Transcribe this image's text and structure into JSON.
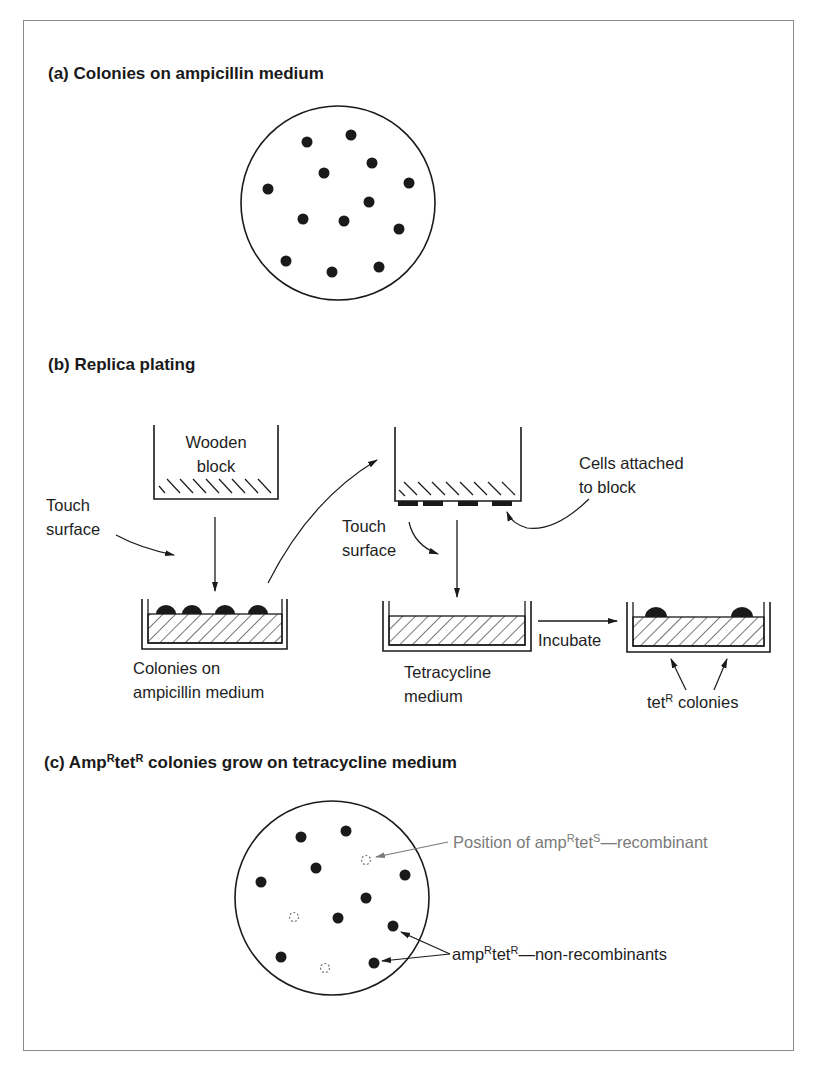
{
  "panels": {
    "a": {
      "title": "(a)  Colonies on ampicillin medium",
      "plate": {
        "center": [
          338,
          203
        ],
        "radius": 97,
        "colonies": [
          [
            307,
            142
          ],
          [
            351,
            135
          ],
          [
            372,
            163
          ],
          [
            324,
            173
          ],
          [
            409,
            183
          ],
          [
            268,
            189
          ],
          [
            369,
            202
          ],
          [
            303,
            219
          ],
          [
            344,
            221
          ],
          [
            399,
            229
          ],
          [
            286,
            261
          ],
          [
            332,
            272
          ],
          [
            379,
            267
          ]
        ]
      }
    },
    "b": {
      "title": "(b)  Replica plating",
      "wooden_block": {
        "line1": "Wooden",
        "line2": "block"
      },
      "touch_surface_1": {
        "line1": "Touch",
        "line2": "surface"
      },
      "touch_surface_2": {
        "line1": "Touch",
        "line2": "surface"
      },
      "cells_attached": {
        "line1": "Cells attached",
        "line2": "to block"
      },
      "dish_ampicillin": {
        "line1": "Colonies on",
        "line2": "ampicillin medium"
      },
      "dish_tetracycline": {
        "line1": "Tetracycline",
        "line2": "medium"
      },
      "incubate": "Incubate",
      "tet_colonies": {
        "prefix": "tet",
        "sup": "R",
        "suffix": " colonies"
      }
    },
    "c": {
      "title_prefix": "(c)  Amp",
      "title_sup1": "R",
      "title_mid": "tet",
      "title_sup2": "R",
      "title_suffix": " colonies grow on tetracycline medium",
      "plate": {
        "center": [
          332,
          898
        ],
        "radius": 97,
        "colonies": [
          [
            301,
            837
          ],
          [
            346,
            831
          ],
          [
            316,
            868
          ],
          [
            261,
            882
          ],
          [
            405,
            875
          ],
          [
            366,
            898
          ],
          [
            338,
            918
          ],
          [
            393,
            926
          ],
          [
            281,
            957
          ],
          [
            374,
            963
          ]
        ],
        "missing_positions": [
          [
            366,
            860
          ],
          [
            294,
            917
          ],
          [
            325,
            968
          ]
        ]
      },
      "recombinant_label": {
        "prefix": "Position of amp",
        "sup1": "R",
        "mid": "tet",
        "sup2": "S",
        "suffix": "—recombinant"
      },
      "nonrecombinant_label": {
        "prefix": "amp",
        "sup1": "R",
        "mid": "tet",
        "sup2": "R",
        "suffix": "—non-recombinants"
      }
    }
  },
  "colors": {
    "ink": "#1a1a1a",
    "gray_annotation": "#7a7a7a",
    "frame": "#8a8a8a"
  }
}
